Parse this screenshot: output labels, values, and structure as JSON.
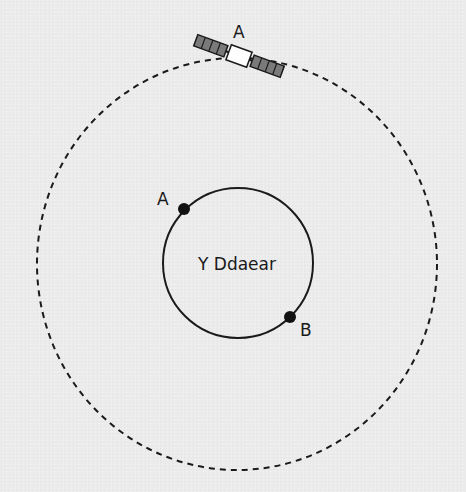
{
  "diagram": {
    "satellite": {
      "label": "A",
      "icon": "satellite-icon"
    },
    "earth": {
      "label": "Y Ddaear"
    },
    "points": [
      {
        "label": "A"
      },
      {
        "label": "B"
      }
    ],
    "orbit": {
      "style": "dashed"
    },
    "colors": {
      "background": "#ebebeb",
      "line": "#1a1a1a",
      "panel": "#7a7a7a",
      "satellite_body": "#ffffff"
    }
  }
}
